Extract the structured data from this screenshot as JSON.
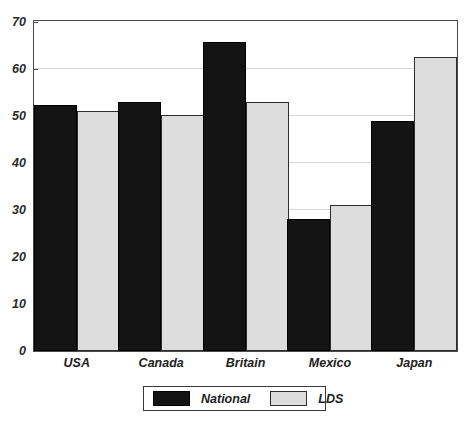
{
  "chart_data": {
    "type": "bar",
    "title": "",
    "xlabel": "",
    "ylabel": "",
    "ylim": [
      0,
      70
    ],
    "ytick_step": 10,
    "yticks": [
      "0",
      "10",
      "20",
      "30",
      "40",
      "50",
      "60",
      "70"
    ],
    "grid": true,
    "grid_axis": "y",
    "legend_position": "bottom-center",
    "categories": [
      "USA",
      "Canada",
      "Britain",
      "Mexico",
      "Japan"
    ],
    "series": [
      {
        "name": "National",
        "color": "#141414",
        "values": [
          52.3,
          52.8,
          65.6,
          28.0,
          48.8
        ]
      },
      {
        "name": "LDS",
        "color": "#dddddd",
        "values": [
          51.0,
          50.2,
          53.0,
          31.0,
          62.5
        ]
      }
    ]
  },
  "legend": {
    "items": [
      {
        "label": "National",
        "swatch": "national"
      },
      {
        "label": "LDS",
        "swatch": "lds"
      }
    ]
  }
}
